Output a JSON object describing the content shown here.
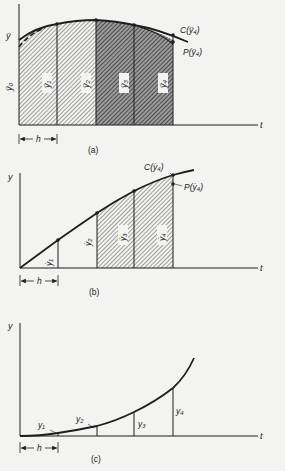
{
  "figure": {
    "panel_a": {
      "caption": "(a)",
      "axis_y_label": "ÿ",
      "axis_y0_label": "ÿ₀",
      "axis_x_label": "t",
      "step_label": "h",
      "strip_labels": [
        "ÿ₁",
        "ÿ₂",
        "ÿ₃",
        "ÿ₄"
      ],
      "corrector_label": "C(ÿ₄)",
      "predictor_label": "P(ÿ₄)"
    },
    "panel_b": {
      "caption": "(b)",
      "axis_y_label": "y",
      "axis_x_label": "t",
      "step_label": "h",
      "strip_labels": [
        "ẏ₁",
        "ẏ₂",
        "ẏ₃",
        "ẏ₄"
      ],
      "corrector_label": "C(ẏ₄)",
      "predictor_label": "P(ẏ₄)"
    },
    "panel_c": {
      "caption": "(c)",
      "axis_y_label": "y",
      "axis_x_label": "t",
      "step_label": "h",
      "ordinate_labels": [
        "y₁",
        "y₂",
        "y₃",
        "y₄"
      ]
    }
  },
  "colors": {
    "ink": "#1e1e1e",
    "hatch_light": "#8a8a8a",
    "hatch_dark": "#3a3a3a",
    "paper": "#f3f3f1"
  }
}
